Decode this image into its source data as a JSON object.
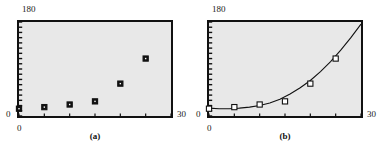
{
  "figure": {
    "panels": [
      {
        "caption": "(a)",
        "y_top_label": "180",
        "y_zero_label": "0",
        "x_zero_label": "0",
        "x_max_label": "30"
      },
      {
        "caption": "(b)",
        "y_top_label": "180",
        "y_zero_label": "0",
        "x_zero_label": "0",
        "x_max_label": "30"
      }
    ]
  },
  "chart_data": [
    {
      "type": "scatter",
      "title": "",
      "xlabel": "",
      "ylabel": "",
      "xlim": [
        0,
        30
      ],
      "ylim": [
        0,
        180
      ],
      "grid": false,
      "legend": null,
      "annotations": [
        "(a)"
      ],
      "xticks": [
        0,
        5,
        10,
        15,
        20,
        25,
        30
      ],
      "xticklabels": [
        "0",
        "",
        "",
        "",
        "",
        "",
        "30"
      ],
      "yticklabels": [
        "0",
        "180"
      ],
      "y_minor_tick_count": 18,
      "series": [
        {
          "name": "data",
          "marker": "filled-square",
          "x": [
            0,
            5,
            10,
            15,
            20,
            25
          ],
          "y": [
            14,
            17,
            22,
            28,
            62,
            110
          ]
        }
      ]
    },
    {
      "type": "scatter",
      "title": "",
      "xlabel": "",
      "ylabel": "",
      "xlim": [
        0,
        30
      ],
      "ylim": [
        0,
        180
      ],
      "grid": false,
      "legend": null,
      "annotations": [
        "(b)"
      ],
      "xticks": [
        0,
        5,
        10,
        15,
        20,
        25,
        30
      ],
      "xticklabels": [
        "0",
        "",
        "",
        "",
        "",
        "",
        "30"
      ],
      "yticklabels": [
        "0",
        "180"
      ],
      "y_minor_tick_count": 18,
      "series": [
        {
          "name": "data",
          "marker": "open-square",
          "x": [
            0,
            5,
            10,
            15,
            20,
            25
          ],
          "y": [
            14,
            17,
            22,
            28,
            62,
            110
          ]
        },
        {
          "name": "fitted-curve",
          "marker": "none",
          "style": "solid-line",
          "x": [
            0,
            2,
            4,
            6,
            8,
            10,
            12,
            14,
            16,
            18,
            20,
            22,
            24,
            26,
            28,
            30
          ],
          "y": [
            15,
            14,
            14,
            15,
            17,
            20,
            25,
            32,
            42,
            54,
            68,
            85,
            104,
            126,
            150,
            176
          ]
        }
      ]
    }
  ],
  "colors": {
    "plot_background": "#e8e8e8",
    "frame": "#111111",
    "marker": "#111111",
    "curve": "#111111",
    "page_background": "#ffffff"
  }
}
